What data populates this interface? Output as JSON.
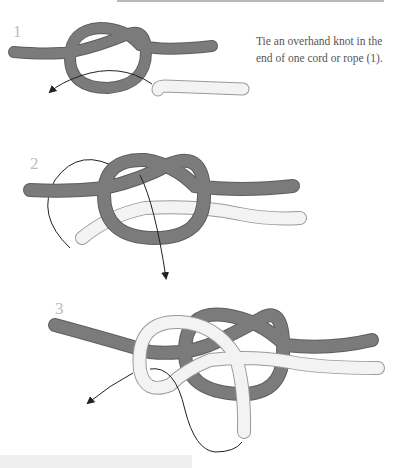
{
  "steps": [
    {
      "number": "1",
      "caption": "Tie an overhand knot in the end of one cord or rope (1)."
    },
    {
      "number": "2",
      "caption": ""
    },
    {
      "number": "3",
      "caption": ""
    }
  ],
  "colors": {
    "dark_rope": "#7b7b7b",
    "dark_rope_edge": "#5e5e5e",
    "light_rope": "#f3f3f3",
    "light_rope_edge": "#9a9a9a",
    "arrow": "#222222",
    "step_number": "#bdbdbd"
  }
}
